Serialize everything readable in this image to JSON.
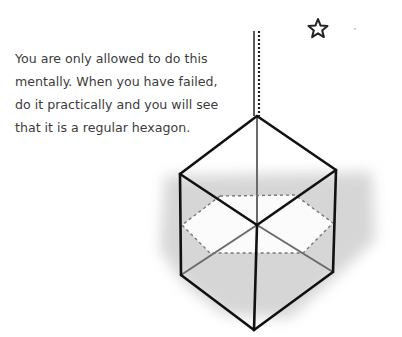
{
  "caption": {
    "lines": [
      "You are only allowed to do this",
      "mentally. When you have failed,",
      "do it practically and you will see",
      "that it is a regular hexagon."
    ]
  },
  "figure": {
    "icons": [
      "star-icon",
      "string-icon"
    ],
    "colors": {
      "edge": "#111111",
      "hidden_edge": "#666666",
      "shadow": "#d4d4d4",
      "dashed": "#777777"
    }
  }
}
